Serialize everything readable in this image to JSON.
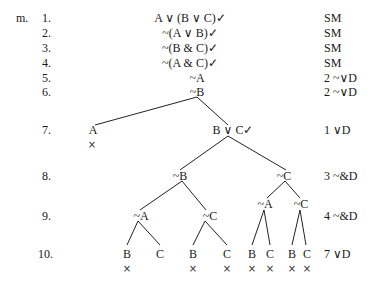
{
  "problem_label": "m.",
  "check_mark": "✓",
  "cross": "×",
  "lines": [
    {
      "num": "1.",
      "formula": "A ∨ (B ∨ C)",
      "checked": true,
      "justification": "SM"
    },
    {
      "num": "2.",
      "formula": "~(A ∨ B)",
      "checked": true,
      "justification": "SM"
    },
    {
      "num": "3.",
      "formula": "~(B & C)",
      "checked": true,
      "justification": "SM"
    },
    {
      "num": "4.",
      "formula": "~(A & C)",
      "checked": true,
      "justification": "SM"
    },
    {
      "num": "5.",
      "formula": "~A",
      "checked": false,
      "justification": "2  ~∨D"
    },
    {
      "num": "6.",
      "formula": "~B",
      "checked": false,
      "justification": "2  ~∨D"
    },
    {
      "num": "7.",
      "justification": "1  ∨D"
    },
    {
      "num": "8.",
      "justification": "3  ~&D"
    },
    {
      "num": "9.",
      "justification": "4  ~&D"
    },
    {
      "num": "10.",
      "justification": "7  ∨D"
    }
  ],
  "tree": {
    "row7": {
      "left": "A",
      "right": "B ∨ C"
    },
    "row8": {
      "left": "~B",
      "right": "~C"
    },
    "row9": {
      "ll": "~A",
      "lr": "~C",
      "rl": "~A",
      "rr": "~C"
    },
    "row10": [
      "B",
      "C",
      "B",
      "C",
      "B",
      "C",
      "B",
      "C"
    ]
  }
}
